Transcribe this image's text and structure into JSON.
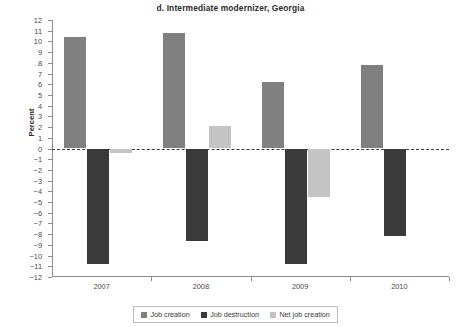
{
  "chart_data": {
    "type": "bar",
    "title": "d. Intermediate modernizer, Georgia",
    "xlabel": "",
    "ylabel": "Percent",
    "categories": [
      "2007",
      "2008",
      "2009",
      "2010"
    ],
    "series": [
      {
        "name": "Job creation",
        "color": "#808080",
        "values": [
          10.4,
          10.8,
          6.2,
          7.8
        ]
      },
      {
        "name": "Job destruction",
        "color": "#3a3a3a",
        "values": [
          -10.8,
          -8.6,
          -10.8,
          -8.2
        ]
      },
      {
        "name": "Net job creation",
        "color": "#c4c4c4",
        "values": [
          -0.4,
          2.1,
          -4.5,
          0.0
        ]
      }
    ],
    "ylim": [
      -12,
      12
    ],
    "yticks": [
      12,
      11,
      10,
      9,
      8,
      7,
      6,
      5,
      4,
      3,
      2,
      1,
      0,
      -1,
      -2,
      -3,
      -4,
      -5,
      -6,
      -7,
      -8,
      -9,
      -10,
      -11,
      -12
    ],
    "ytick_labels": [
      "12",
      "11",
      "10",
      "9",
      "8",
      "7",
      "6",
      "5",
      "4",
      "3",
      "2",
      "1",
      "0",
      "−1",
      "−2",
      "−3",
      "−4",
      "−5",
      "−6",
      "−7",
      "−8",
      "−9",
      "−10",
      "−11",
      "−12"
    ],
    "grid": false,
    "zero_line": true,
    "legend_position": "bottom"
  },
  "legend": {
    "items": [
      {
        "label": "Job creation",
        "color": "#808080"
      },
      {
        "label": "Job destruction",
        "color": "#3a3a3a"
      },
      {
        "label": "Net job creation",
        "color": "#c4c4c4"
      }
    ]
  }
}
